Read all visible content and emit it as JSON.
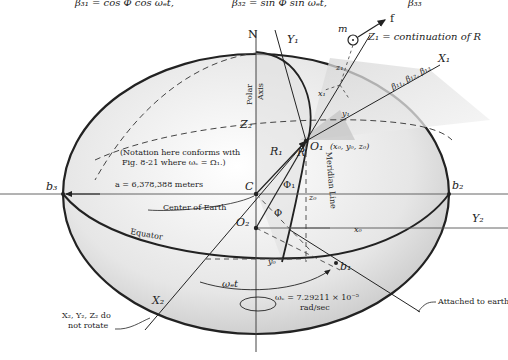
{
  "header_formula": {
    "beta31": "β₃₁ = cos Φ cos ωₑt,",
    "beta32": "β₃₂ = sin Φ sin ωₑt,",
    "beta33": "β₃₃"
  },
  "labels": {
    "north": "N",
    "polar_axis_1": "Polar",
    "polar_axis_2": "Axis",
    "y1": "Y₁",
    "x1": "X₁",
    "z1": "Z₁ = continuation of R",
    "mass": "m",
    "force": "f",
    "z1_small": "z₁",
    "x1_small": "x₁",
    "y1_small": "y₁",
    "betas": "β₁₁, β₁₂, β₁₃",
    "o1": "O₁",
    "o1_coords": "(x₀, y₀, z₀)",
    "z2": "Z₂",
    "note_line1": "(Notation here conforms with",
    "note_line2": "Fig. 8-21 where ωₑ = Ω₁.)",
    "r1": "R₁",
    "r": "R",
    "meridian": "Meridian Line",
    "c": "C",
    "phi1": "Φ₁",
    "phi": "Φ",
    "b3": "b₃",
    "b2": "b₂",
    "b1": "b₁",
    "semi_axis": "a = 6,378,388 meters",
    "center": "Center of Earth",
    "o2": "O₂",
    "z0": "z₀",
    "x0": "x₀",
    "y0": "y₀",
    "y2": "Y₂",
    "equator": "Equator",
    "x2": "X₂",
    "omega_t": "ωₑt",
    "omega_value_1": "ωₑ = 7.29211 × 10⁻⁵",
    "omega_value_2": "rad/sec",
    "attached": "Attached to earth",
    "no_rotate_1": "X₂, Y₂, Z₂ do",
    "no_rotate_2": "not rotate"
  },
  "colors": {
    "ink": "#222222",
    "shade_light": "#efefef",
    "shade_dark": "#cfcfcf"
  }
}
